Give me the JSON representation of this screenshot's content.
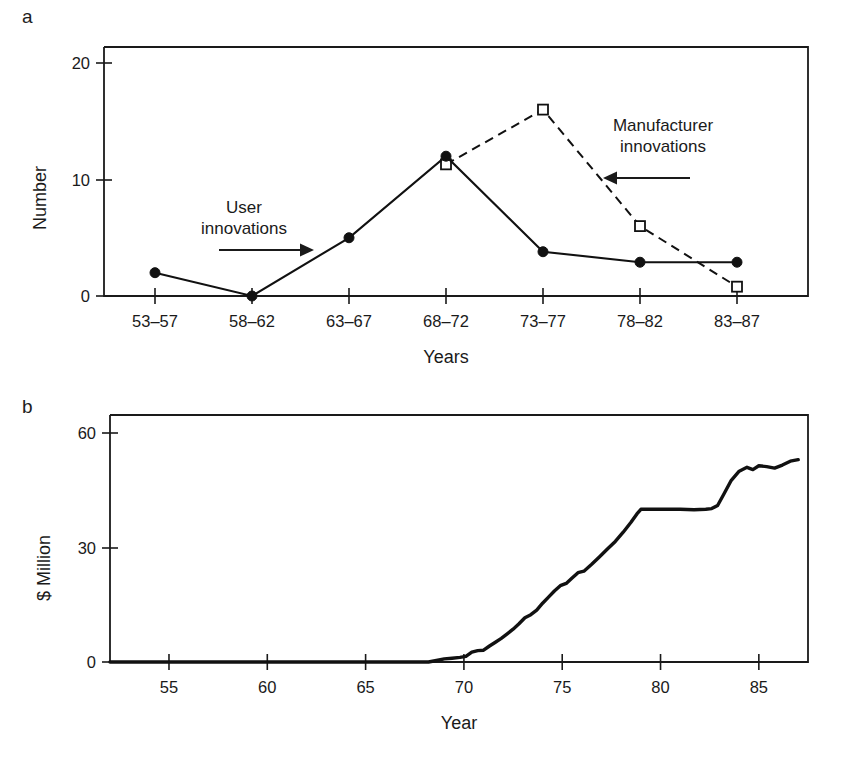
{
  "figure": {
    "panel_a_letter": "a",
    "panel_b_letter": "b"
  },
  "chart_data": [
    {
      "id": "panel-a",
      "type": "line",
      "title": "",
      "xlabel": "Years",
      "ylabel": "Number",
      "categories": [
        "53–57",
        "58–62",
        "63–67",
        "68–72",
        "73–77",
        "78–82",
        "83–87"
      ],
      "ylim": [
        0,
        21
      ],
      "yticks": [
        0,
        10,
        20
      ],
      "ytick_labels": [
        "0",
        "10",
        "20"
      ],
      "grid": false,
      "legend_position": "in-plot-annotations",
      "series": [
        {
          "name": "User innovations",
          "marker": "filled-circle",
          "linestyle": "solid",
          "values": [
            2,
            0,
            5,
            12,
            3.8,
            2.9,
            2.9
          ]
        },
        {
          "name": "Manufacturer innovations",
          "marker": "open-square",
          "linestyle": "dashed",
          "values": [
            null,
            null,
            null,
            11.3,
            16,
            6,
            0.8
          ]
        }
      ],
      "annotations": [
        {
          "text_line1": "User",
          "text_line2": "innovations",
          "arrow": "right"
        },
        {
          "text_line1": "Manufacturer",
          "text_line2": "innovations",
          "arrow": "left"
        }
      ]
    },
    {
      "id": "panel-b",
      "type": "line",
      "title": "",
      "xlabel": "Year",
      "ylabel": "$ Million",
      "xlim": [
        52,
        87.5
      ],
      "ylim": [
        0,
        64
      ],
      "xticks": [
        55,
        60,
        65,
        70,
        75,
        80,
        85
      ],
      "xtick_labels": [
        "55",
        "60",
        "65",
        "70",
        "75",
        "80",
        "85"
      ],
      "yticks": [
        0,
        30,
        60
      ],
      "ytick_labels": [
        "0",
        "30",
        "60"
      ],
      "grid": false,
      "series": [
        {
          "name": "Cumulative sales",
          "linestyle": "solid",
          "x": [
            68.2,
            68.6,
            69.0,
            69.4,
            69.8,
            70.1,
            70.4,
            70.7,
            71.0,
            71.3,
            71.6,
            71.9,
            72.2,
            72.5,
            72.8,
            73.1,
            73.4,
            73.7,
            74.0,
            74.3,
            74.6,
            74.9,
            75.2,
            75.5,
            75.8,
            76.1,
            76.5,
            76.9,
            77.3,
            77.7,
            78.1,
            78.5,
            78.8,
            79.0,
            79.6,
            80.3,
            81.0,
            81.7,
            82.3,
            82.6,
            82.9,
            83.2,
            83.6,
            84.0,
            84.4,
            84.7,
            85.0,
            85.4,
            85.8,
            86.2,
            86.6,
            87.0
          ],
          "y": [
            0,
            0.4,
            0.8,
            1.0,
            1.2,
            1.5,
            2.6,
            3.0,
            3.1,
            4.2,
            5.2,
            6.2,
            7.4,
            8.6,
            10.0,
            11.6,
            12.4,
            13.6,
            15.4,
            17.0,
            18.6,
            20.0,
            20.6,
            22.0,
            23.4,
            23.8,
            25.6,
            27.6,
            29.6,
            31.6,
            34.0,
            36.6,
            38.8,
            40.0,
            40.0,
            40.0,
            40.0,
            39.9,
            40.0,
            40.2,
            41.0,
            43.8,
            47.6,
            50.0,
            51.0,
            50.4,
            51.4,
            51.2,
            50.8,
            51.6,
            52.6,
            53.0
          ]
        }
      ]
    }
  ]
}
